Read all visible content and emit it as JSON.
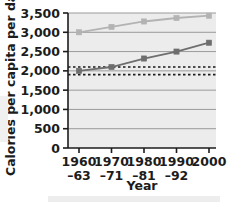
{
  "chart_data": {
    "type": "line",
    "title": "",
    "xlabel": "Year",
    "ylabel": "Calories per capita per day",
    "ylim": [
      0,
      3500
    ],
    "ytick_values": [
      0,
      500,
      1000,
      1500,
      2000,
      2500,
      3000,
      3500
    ],
    "ytick_labels": [
      "0",
      "500",
      "1,000",
      "1,500",
      "2,000",
      "2,500",
      "3,000",
      "3,500"
    ],
    "grid": true,
    "legend": "none",
    "categories": [
      "1960–63",
      "1970–71",
      "1980–81",
      "1990–92",
      "2000"
    ],
    "xtick_labels_line1": [
      "1960",
      "1970",
      "1980",
      "1990",
      "2000"
    ],
    "xtick_labels_line2": [
      "–63",
      "–71",
      "–81",
      "–92",
      ""
    ],
    "series": [
      {
        "name": "upper-line",
        "color": "#b3b3b3",
        "marker": "square",
        "values": [
          3000,
          3140,
          3280,
          3370,
          3430
        ]
      },
      {
        "name": "lower-line",
        "color": "#6e6e6e",
        "marker": "square",
        "values": [
          2000,
          2100,
          2320,
          2500,
          2730
        ]
      }
    ],
    "reference_lines": [
      {
        "name": "upper-dashed-reference",
        "value": 2100,
        "style": "dashed",
        "color": "#4d4d4d"
      },
      {
        "name": "lower-dashed-reference",
        "value": 1900,
        "style": "dashed",
        "color": "#1c1c1c"
      }
    ],
    "plot_background": "#ececec",
    "gridline_color": "#9a9a9a",
    "axis_color": "#1c1c1c"
  }
}
